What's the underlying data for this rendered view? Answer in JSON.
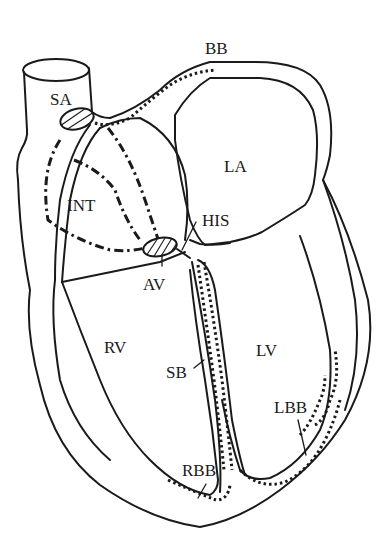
{
  "diagram": {
    "labels": {
      "sa": "SA",
      "bb": "BB",
      "la": "LA",
      "int": "INT",
      "his": "HIS",
      "av": "AV",
      "rv": "RV",
      "lv": "LV",
      "sb": "SB",
      "lbb": "LBB",
      "rbb": "RBB"
    },
    "legend_meaning": {
      "SA": "sinoatrial node",
      "BB": "Bachmann's bundle",
      "LA": "left atrium",
      "INT": "internodal pathways",
      "HIS": "bundle of His",
      "AV": "atrioventricular node",
      "RV": "right ventricle",
      "LV": "left ventricle",
      "SB": "septal branch",
      "LBB": "left bundle branch",
      "RBB": "right bundle branch"
    },
    "colors": {
      "line": "#1a1a1a",
      "background": "#ffffff"
    }
  }
}
